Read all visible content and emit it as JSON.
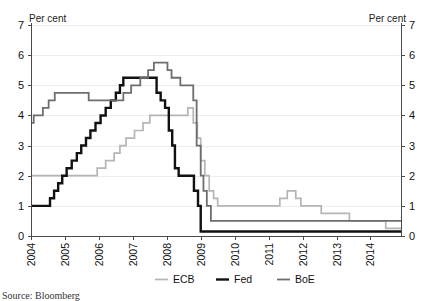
{
  "chart_data": {
    "type": "line",
    "title": "",
    "subtitle": "",
    "xlabel": "",
    "ylabel": "Per cent",
    "y2label": "Per cent",
    "ylim": [
      0,
      7
    ],
    "xlim": [
      2004,
      2014.9
    ],
    "grid": true,
    "grid_axis": "y",
    "legend_position": "bottom-center",
    "y_ticks": [
      0,
      1,
      2,
      3,
      4,
      5,
      6,
      7
    ],
    "y_tick_labels": [
      "0",
      "1",
      "2",
      "3",
      "4",
      "5",
      "6",
      "7"
    ],
    "y2_ticks": [
      0,
      1,
      2,
      3,
      4,
      5,
      6,
      7
    ],
    "y2_tick_labels": [
      "0",
      "1",
      "2",
      "3",
      "4",
      "5",
      "6",
      "7"
    ],
    "x_ticks": [
      2004,
      2005,
      2006,
      2007,
      2008,
      2009,
      2010,
      2011,
      2012,
      2013,
      2014
    ],
    "x_tick_labels": [
      "2004",
      "2005",
      "2006",
      "2007",
      "2008",
      "2009",
      "2010",
      "2011",
      "2012",
      "2013",
      "2014"
    ],
    "step_style": "post",
    "series": [
      {
        "name": "ECB",
        "color": "#b5b5b5",
        "width": 1.7,
        "points": [
          [
            2004.0,
            2.0
          ],
          [
            2005.9,
            2.0
          ],
          [
            2005.95,
            2.25
          ],
          [
            2006.2,
            2.5
          ],
          [
            2006.45,
            2.75
          ],
          [
            2006.62,
            3.0
          ],
          [
            2006.8,
            3.25
          ],
          [
            2007.05,
            3.5
          ],
          [
            2007.3,
            3.75
          ],
          [
            2007.5,
            4.0
          ],
          [
            2008.55,
            4.0
          ],
          [
            2008.62,
            4.25
          ],
          [
            2008.78,
            3.75
          ],
          [
            2008.9,
            3.25
          ],
          [
            2009.0,
            2.5
          ],
          [
            2009.12,
            2.0
          ],
          [
            2009.25,
            1.5
          ],
          [
            2009.38,
            1.25
          ],
          [
            2009.5,
            1.0
          ],
          [
            2011.2,
            1.0
          ],
          [
            2011.33,
            1.25
          ],
          [
            2011.55,
            1.5
          ],
          [
            2011.8,
            1.25
          ],
          [
            2011.95,
            1.0
          ],
          [
            2012.55,
            0.75
          ],
          [
            2013.38,
            0.5
          ],
          [
            2014.45,
            0.25
          ],
          [
            2014.9,
            0.25
          ]
        ]
      },
      {
        "name": "Fed",
        "color": "#111111",
        "width": 2.4,
        "points": [
          [
            2004.0,
            1.0
          ],
          [
            2004.5,
            1.0
          ],
          [
            2004.56,
            1.25
          ],
          [
            2004.68,
            1.5
          ],
          [
            2004.8,
            1.75
          ],
          [
            2004.92,
            2.0
          ],
          [
            2005.05,
            2.25
          ],
          [
            2005.2,
            2.5
          ],
          [
            2005.35,
            2.75
          ],
          [
            2005.48,
            3.0
          ],
          [
            2005.62,
            3.25
          ],
          [
            2005.75,
            3.5
          ],
          [
            2005.9,
            3.75
          ],
          [
            2006.05,
            4.0
          ],
          [
            2006.2,
            4.25
          ],
          [
            2006.35,
            4.5
          ],
          [
            2006.5,
            4.75
          ],
          [
            2006.62,
            5.0
          ],
          [
            2006.72,
            5.25
          ],
          [
            2007.62,
            5.25
          ],
          [
            2007.7,
            4.75
          ],
          [
            2007.82,
            4.5
          ],
          [
            2007.95,
            4.25
          ],
          [
            2008.06,
            3.5
          ],
          [
            2008.16,
            3.0
          ],
          [
            2008.24,
            2.25
          ],
          [
            2008.35,
            2.0
          ],
          [
            2008.62,
            2.0
          ],
          [
            2008.8,
            1.5
          ],
          [
            2008.92,
            1.0
          ],
          [
            2009.0,
            0.15
          ],
          [
            2014.9,
            0.15
          ]
        ]
      },
      {
        "name": "BoE",
        "color": "#6e6e6e",
        "width": 1.8,
        "points": [
          [
            2004.0,
            3.75
          ],
          [
            2004.08,
            4.0
          ],
          [
            2004.35,
            4.25
          ],
          [
            2004.52,
            4.5
          ],
          [
            2004.7,
            4.75
          ],
          [
            2005.62,
            4.75
          ],
          [
            2005.7,
            4.5
          ],
          [
            2006.6,
            4.5
          ],
          [
            2006.72,
            4.75
          ],
          [
            2006.95,
            5.0
          ],
          [
            2007.22,
            5.25
          ],
          [
            2007.45,
            5.5
          ],
          [
            2007.62,
            5.75
          ],
          [
            2007.95,
            5.75
          ],
          [
            2008.02,
            5.5
          ],
          [
            2008.14,
            5.25
          ],
          [
            2008.4,
            5.0
          ],
          [
            2008.78,
            4.5
          ],
          [
            2008.88,
            3.0
          ],
          [
            2009.0,
            2.0
          ],
          [
            2009.08,
            1.5
          ],
          [
            2009.18,
            1.0
          ],
          [
            2009.3,
            0.5
          ],
          [
            2014.9,
            0.5
          ]
        ]
      }
    ],
    "legend": [
      {
        "label": "ECB",
        "color": "#b5b5b5",
        "width": 1.7
      },
      {
        "label": "Fed",
        "color": "#111111",
        "width": 2.4
      },
      {
        "label": "BoE",
        "color": "#6e6e6e",
        "width": 1.8
      }
    ],
    "annotations": []
  },
  "footer": {
    "source": "Source: Bloomberg"
  }
}
